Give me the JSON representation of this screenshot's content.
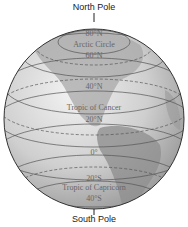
{
  "diagram": {
    "north_pole_label": "North Pole",
    "south_pole_label": "South Pole",
    "latitudes": [
      {
        "label": "80°N",
        "y": 33
      },
      {
        "label": "Arctic Circle",
        "y": 44
      },
      {
        "label": "60°N",
        "y": 55
      },
      {
        "label": "40°N",
        "y": 86
      },
      {
        "label": "Tropic of Cancer",
        "y": 107
      },
      {
        "label": "20°N",
        "y": 119
      },
      {
        "label": "0°",
        "y": 152
      },
      {
        "label": "20°S",
        "y": 181
      },
      {
        "label": "Tropic of Capricorn",
        "y": 189
      },
      {
        "label": "40°S",
        "y": 199
      }
    ],
    "colors": {
      "globe": "#c8c8c8",
      "land": "#9a9a9a",
      "lines": "#555555",
      "outline": "#333333"
    }
  }
}
